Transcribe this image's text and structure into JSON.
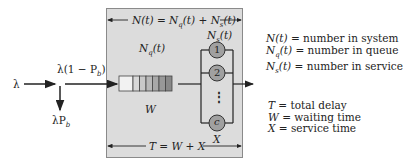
{
  "input": {
    "arrival_rate": "λ",
    "admitted_rate": "λ(1 − P_b)",
    "admitted_rate_display": "λ(1 − P",
    "admitted_rate_sub": "b",
    "blocked_rate_display": "λP",
    "blocked_rate_sub": "b"
  },
  "system": {
    "top_span_label": "N(t) = N_q(t) + N_s(t)",
    "queue_label": "N_q(t)",
    "service_label": "N_s(t)",
    "waiting_label": "W",
    "service_time_label": "X",
    "bottom_span_label": "T = W + X",
    "queue_cell_colors": [
      "#f2f2f2",
      "#d8d8d8",
      "#c8c8c8",
      "#b8b8b8",
      "#a8a8a8",
      "#989898",
      "#888888"
    ],
    "servers": [
      "1",
      "2",
      "⋮",
      "c"
    ]
  },
  "legend": {
    "top": [
      {
        "symbol": "N(t)",
        "desc": "= number in system"
      },
      {
        "symbol": "N_q(t)",
        "desc": "= number in queue"
      },
      {
        "symbol": "N_s(t)",
        "desc": "= number in service"
      }
    ],
    "bottom": [
      {
        "symbol": "T",
        "desc": "= total delay"
      },
      {
        "symbol": "W",
        "desc": "= waiting time"
      },
      {
        "symbol": "X",
        "desc": "= service time"
      }
    ]
  },
  "colors": {
    "box_fill": "#dcdcdc",
    "server_fill": "#a0a0a0",
    "line": "#222222"
  }
}
